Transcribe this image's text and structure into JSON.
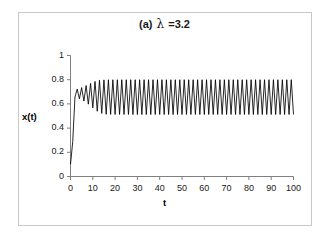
{
  "figure": {
    "frame_color": "#c9c9c9",
    "background": "#ffffff",
    "line_color": "#000000"
  },
  "title": {
    "panel": "(a)",
    "symbol": "λ",
    "value": "=3.2",
    "full": "(a) λ =3.2"
  },
  "axes": {
    "ylabel": "x(t)",
    "xlabel": "t",
    "yticks": [
      "0",
      "0.2",
      "0.4",
      "0.6",
      "0.8",
      "1"
    ],
    "ytick_values": [
      0,
      0.2,
      0.4,
      0.6,
      0.8,
      1
    ],
    "xticks": [
      "0",
      "10",
      "20",
      "30",
      "40",
      "50",
      "60",
      "70",
      "80",
      "90",
      "100"
    ],
    "xtick_values": [
      0,
      10,
      20,
      30,
      40,
      50,
      60,
      70,
      80,
      90,
      100
    ]
  },
  "chart_data": {
    "type": "line",
    "subtitle": "",
    "xlabel": "t",
    "ylabel": "x(t)",
    "xlim": [
      0,
      100
    ],
    "ylim": [
      0,
      1
    ],
    "grid": false,
    "legend": null,
    "series": [
      {
        "name": "x(t)",
        "color": "#000000",
        "description": "Logistic map x(t+1) = lambda * x(t) * (1 - x(t)) with lambda = 3.2, x(0) = 0.1; transient rise then period-2 oscillation",
        "lambda": 3.2,
        "x0": 0.1,
        "steady_state_low": 0.513,
        "steady_state_high": 0.799,
        "x": [
          0,
          1,
          2,
          3,
          4,
          5,
          6,
          7,
          8,
          9,
          10,
          11,
          12,
          13,
          14,
          15,
          16,
          17,
          18,
          19,
          20,
          21,
          22,
          23,
          24,
          25,
          26,
          27,
          28,
          29,
          30,
          31,
          32,
          33,
          34,
          35,
          36,
          37,
          38,
          39,
          40,
          41,
          42,
          43,
          44,
          45,
          46,
          47,
          48,
          49,
          50,
          51,
          52,
          53,
          54,
          55,
          56,
          57,
          58,
          59,
          60,
          61,
          62,
          63,
          64,
          65,
          66,
          67,
          68,
          69,
          70,
          71,
          72,
          73,
          74,
          75,
          76,
          77,
          78,
          79,
          80,
          81,
          82,
          83,
          84,
          85,
          86,
          87,
          88,
          89,
          90,
          91,
          92,
          93,
          94,
          95,
          96,
          97,
          98,
          99,
          100
        ],
        "values": [
          0.1,
          0.288,
          0.6563,
          0.7219,
          0.6423,
          0.7351,
          0.6232,
          0.7515,
          0.5976,
          0.7696,
          0.5674,
          0.7855,
          0.5392,
          0.7951,
          0.5213,
          0.7986,
          0.5147,
          0.7995,
          0.513,
          0.7997,
          0.5126,
          0.7998,
          0.5124,
          0.7998,
          0.5124,
          0.7999,
          0.5123,
          0.7999,
          0.5123,
          0.7999,
          0.5123,
          0.7999,
          0.5123,
          0.7999,
          0.5123,
          0.7999,
          0.5123,
          0.7999,
          0.5123,
          0.7999,
          0.5123,
          0.7999,
          0.5123,
          0.7999,
          0.5123,
          0.7999,
          0.5123,
          0.7999,
          0.5123,
          0.7999,
          0.5123,
          0.7999,
          0.5123,
          0.7999,
          0.5123,
          0.7999,
          0.5123,
          0.7999,
          0.5123,
          0.7999,
          0.5123,
          0.7999,
          0.5123,
          0.7999,
          0.5123,
          0.7999,
          0.5123,
          0.7999,
          0.5123,
          0.7999,
          0.5123,
          0.7999,
          0.5123,
          0.7999,
          0.5123,
          0.7999,
          0.5123,
          0.7999,
          0.5123,
          0.7999,
          0.5123,
          0.7999,
          0.5123,
          0.7999,
          0.5123,
          0.7999,
          0.5123,
          0.7999,
          0.5123,
          0.7999,
          0.5123,
          0.7999,
          0.5123,
          0.7999,
          0.5123,
          0.7999,
          0.5123,
          0.7999,
          0.5123,
          0.7999,
          0.5123
        ]
      }
    ]
  }
}
